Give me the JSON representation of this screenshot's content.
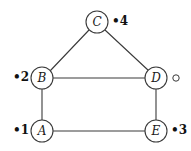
{
  "figure": {
    "type": "graph-diagram",
    "background_color": "#ffffff",
    "stroke_color": "#333333",
    "text_color": "#1a1a1a"
  },
  "vertices": [
    {
      "id": "C",
      "label": "C",
      "cx": 97,
      "cy": 22,
      "r": 11
    },
    {
      "id": "B",
      "label": "B",
      "cx": 42,
      "cy": 78,
      "r": 11
    },
    {
      "id": "D",
      "label": "D",
      "cx": 156,
      "cy": 78,
      "r": 11
    },
    {
      "id": "A",
      "label": "A",
      "cx": 42,
      "cy": 131,
      "r": 11
    },
    {
      "id": "E",
      "label": "E",
      "cx": 156,
      "cy": 131,
      "r": 11
    }
  ],
  "edges": [
    {
      "from": "B",
      "to": "C"
    },
    {
      "from": "C",
      "to": "D"
    },
    {
      "from": "B",
      "to": "D"
    },
    {
      "from": "B",
      "to": "A"
    },
    {
      "from": "D",
      "to": "E"
    },
    {
      "from": "A",
      "to": "E"
    }
  ],
  "markers": [
    {
      "id": "m4",
      "text": "•4",
      "x": 112,
      "y": 15,
      "near": "C"
    },
    {
      "id": "m2",
      "text": "•2",
      "x": 13,
      "y": 71,
      "near": "B"
    },
    {
      "id": "m1",
      "text": "•1",
      "x": 13,
      "y": 124,
      "near": "A"
    },
    {
      "id": "m3",
      "text": "•3",
      "x": 171,
      "y": 124,
      "near": "E"
    }
  ],
  "open_marker": {
    "id": "m-open",
    "cx": 176,
    "cy": 78,
    "r": 3,
    "near": "D"
  }
}
